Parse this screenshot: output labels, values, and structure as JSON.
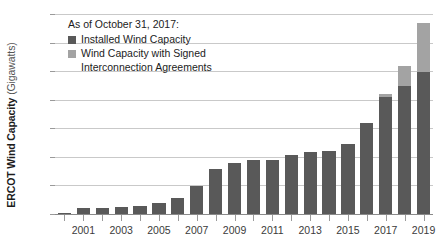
{
  "chart_data": {
    "type": "bar",
    "subtype": "stacked",
    "title": "",
    "xlabel": "",
    "ylabel": "ERCOT Wind Capacity (Gigawatts)",
    "ylabel_bold": "ERCOT Wind Capacity",
    "ylabel_unit": " (Gigawatts)",
    "ylim": [
      0,
      35
    ],
    "ytick_values": [
      0,
      5,
      10,
      15,
      20,
      25,
      30,
      35
    ],
    "ytick_labels": [
      "0",
      "5",
      "10",
      "15",
      "20",
      "25",
      "30",
      "35"
    ],
    "grid": true,
    "grid_axis": "y",
    "legend_position": "top-left",
    "categories": [
      "2000",
      "2001",
      "2002",
      "2003",
      "2004",
      "2005",
      "2006",
      "2007",
      "2008",
      "2009",
      "2010",
      "2011",
      "2012",
      "2013",
      "2014",
      "2015",
      "2016",
      "2017",
      "2018",
      "2019"
    ],
    "xtick_labels": [
      "2001",
      "2003",
      "2005",
      "2007",
      "2009",
      "2011",
      "2013",
      "2015",
      "2017",
      "2019"
    ],
    "series": [
      {
        "name": "Installed Wind Capacity",
        "color": "#595959",
        "values": [
          0.2,
          1.1,
          1.1,
          1.3,
          1.4,
          1.9,
          2.8,
          4.9,
          7.9,
          9.0,
          9.4,
          9.5,
          10.3,
          10.9,
          11.1,
          12.3,
          15.9,
          20.5,
          22.4,
          24.8
        ]
      },
      {
        "name": "Wind Capacity with Signed Interconnection Agreements",
        "color": "#a3a3a3",
        "values": [
          0,
          0,
          0,
          0,
          0,
          0,
          0,
          0,
          0,
          0,
          0,
          0,
          0,
          0,
          0,
          0,
          0,
          0.5,
          3.5,
          8.7
        ]
      }
    ],
    "totals": [
      0.2,
      1.1,
      1.1,
      1.3,
      1.4,
      1.9,
      2.8,
      4.9,
      7.9,
      9.0,
      9.4,
      9.5,
      10.3,
      10.9,
      11.1,
      12.3,
      15.9,
      21.0,
      25.9,
      33.5
    ],
    "annotations": []
  },
  "legend": {
    "title": "As of October 31, 2017:",
    "items": [
      {
        "label": "Installed Wind Capacity",
        "color": "#595959"
      },
      {
        "label": "Wind Capacity with Signed\nInterconnection Agreements",
        "color": "#a3a3a3"
      }
    ]
  },
  "colors": {
    "installed": "#595959",
    "signed": "#a3a3a3",
    "gridline": "#c9c9c9",
    "axis": "#8a8a8a",
    "text": "#3b3b3b",
    "background": "#ffffff"
  }
}
